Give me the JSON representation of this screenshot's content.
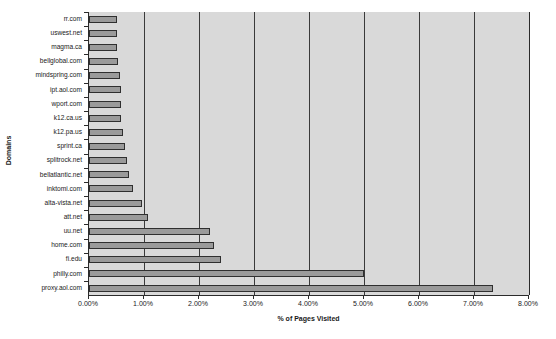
{
  "chart_data": {
    "type": "bar",
    "orientation": "horizontal",
    "title": "",
    "xlabel": "% of Pages Visited",
    "ylabel": "Domains",
    "xlim": [
      0,
      8
    ],
    "xtick_labels": [
      "0.00%",
      "1.00%",
      "2.00%",
      "3.00%",
      "4.00%",
      "5.00%",
      "6.00%",
      "7.00%",
      "8.00%"
    ],
    "xtick_values": [
      0,
      1,
      2,
      3,
      4,
      5,
      6,
      7,
      8
    ],
    "grid": true,
    "legend": "none",
    "categories": [
      "rr.com",
      "uswest.net",
      "magma.ca",
      "bellglobal.com",
      "mindspring.com",
      "ipt.aol.com",
      "wport.com",
      "k12.ca.us",
      "k12.pa.us",
      "sprint.ca",
      "splitrock.net",
      "bellatlantic.net",
      "inktomi.com",
      "alta-vista.net",
      "att.net",
      "uu.net",
      "home.com",
      "fi.edu",
      "philly.com",
      "proxy.aol.com"
    ],
    "values": [
      0.5,
      0.5,
      0.51,
      0.52,
      0.56,
      0.58,
      0.58,
      0.59,
      0.62,
      0.66,
      0.69,
      0.72,
      0.8,
      0.96,
      1.08,
      2.2,
      2.27,
      2.4,
      5.0,
      7.35
    ]
  },
  "colors": {
    "bar_fill": "#9a9a9a",
    "bar_border": "#2f2f2f",
    "plot_background": "#d9d9d9",
    "gridline": "#3a3a3a",
    "axis": "#2b2b2b",
    "page_background": "#ffffff",
    "text": "#1a1a1a"
  }
}
